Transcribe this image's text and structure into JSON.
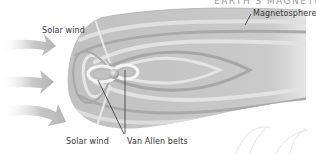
{
  "diagram": {
    "heading_partial": "EARTH'S MAGNETOSPHERE",
    "labels": {
      "solar_wind_top": "Solar wind",
      "solar_wind_bottom": "Solar wind",
      "van_allen_belts": "Van Allen belts",
      "magnetosphere": "Magnetosphere"
    },
    "colors": {
      "background": "#ffffff",
      "magnetosphere_fill": "#c4c4c4",
      "band_dark": "#a8a8a8",
      "band_light": "#e2e2e2",
      "arrow": "#bdbdbd",
      "leader_line": "#333333",
      "text": "#333333"
    }
  }
}
